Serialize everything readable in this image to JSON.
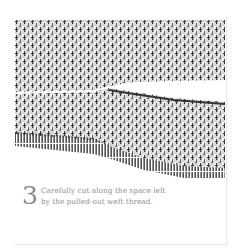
{
  "step": {
    "number": "3",
    "text_line1": "Carefully cut along the space left",
    "text_line2": "by the pulled-out weft thread."
  },
  "illustration": {
    "subject": "woven-fabric-with-cut-gap",
    "fabric_color": "#c9c9c9",
    "thread_dark_color": "#2b2b2b",
    "leader_line_color": "#9a9a9a"
  },
  "colors": {
    "background": "#ffffff",
    "caption_text": "#8f8f8f",
    "panel_border": "#ececec"
  }
}
